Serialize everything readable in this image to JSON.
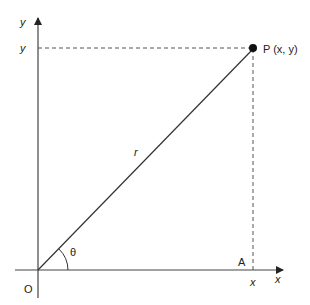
{
  "diagram": {
    "axes": {
      "y_axis_label": "y",
      "x_axis_label": "x"
    },
    "point": {
      "label": "P (x, y)"
    },
    "labels": {
      "y_coordinate": "y",
      "x_coordinate": "x",
      "radius": "r",
      "angle": "θ",
      "origin": "O",
      "foot_point": "A"
    },
    "colors": {
      "line": "#333333",
      "dash": "#555555",
      "text": "#222222",
      "background": "#ffffff"
    }
  }
}
